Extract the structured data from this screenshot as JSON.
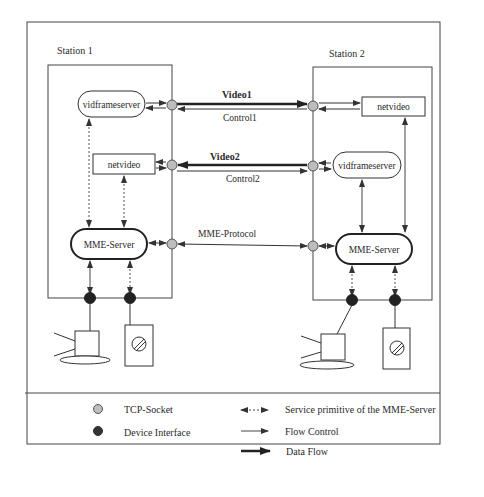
{
  "figure": {
    "stations": [
      {
        "title": "Station 1",
        "components": {
          "vidframeserver": "vidframeserver",
          "netvideo": "netvideo",
          "mme_server": "MME-Server"
        }
      },
      {
        "title": "Station 2",
        "components": {
          "vidframeserver": "vidframeserver",
          "netvideo": "netvideo",
          "mme_server": "MME-Server"
        }
      }
    ],
    "connections": {
      "video1": "Video1",
      "control1": "Control1",
      "video2": "Video2",
      "control2": "Control2",
      "mme_protocol": "MME-Protocol"
    },
    "legend": {
      "tcp_socket": "TCP-Socket",
      "device_interface": "Device Interface",
      "service_primitive": "Service primitive of the MME-Server",
      "flow_control": "Flow Control",
      "data_flow": "Data Flow"
    },
    "colors": {
      "tcp_socket_fill": "#bdbdbd",
      "device_interface_fill": "#222222",
      "line": "#333333"
    }
  }
}
